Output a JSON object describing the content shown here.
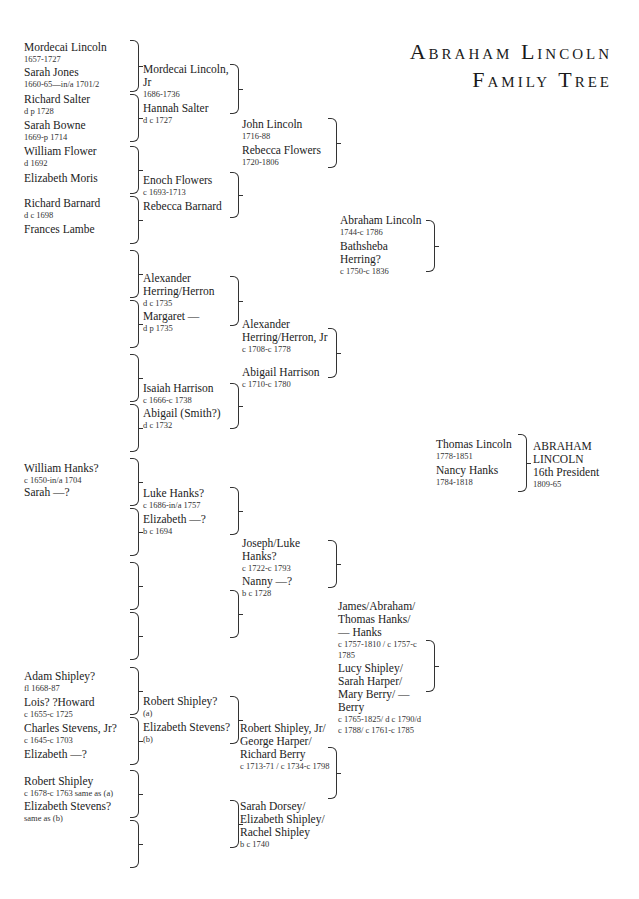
{
  "title": {
    "line1": "Abraham Lincoln",
    "line2": "Family Tree"
  },
  "gen5": [
    {
      "name": "Mordecai Lincoln",
      "dates": "1657-1727"
    },
    {
      "name": "Sarah Jones",
      "dates": "1660-65—in/a 1701/2"
    },
    {
      "name": "Richard Salter",
      "dates": "d p 1728"
    },
    {
      "name": "Sarah Bowne",
      "dates": "1669-p 1714"
    },
    {
      "name": "William Flower",
      "dates": "d 1692"
    },
    {
      "name": "Elizabeth Moris",
      "dates": ""
    },
    {
      "name": "Richard Barnard",
      "dates": "d c 1698"
    },
    {
      "name": "Frances Lambe",
      "dates": ""
    },
    {
      "name": "William Hanks?",
      "dates": "c 1650-in/a 1704"
    },
    {
      "name": "Sarah —?",
      "dates": ""
    },
    {
      "name": "Adam Shipley?",
      "dates": "fl 1668-87"
    },
    {
      "name": "Lois? ?Howard",
      "dates": "c 1655-c 1725"
    },
    {
      "name": "Charles Stevens, Jr?",
      "dates": "c 1645-c 1703"
    },
    {
      "name": "Elizabeth —?",
      "dates": ""
    },
    {
      "name": "Robert Shipley",
      "dates": "c 1678-c 1763 same as (a)"
    },
    {
      "name": "Elizabeth Stevens?",
      "dates": "same as (b)"
    }
  ],
  "gen4": [
    {
      "name": "Mordecai Lincoln, Jr",
      "dates": "1686-1736"
    },
    {
      "name": "Hannah Salter",
      "dates": "d c 1727"
    },
    {
      "name": "Enoch Flowers",
      "dates": "c 1693-1713"
    },
    {
      "name": "Rebecca Barnard",
      "dates": ""
    },
    {
      "name": "Alexander Herring/Herron",
      "dates": "d c 1735"
    },
    {
      "name": "Margaret —",
      "dates": "d p 1735"
    },
    {
      "name": "Isaiah Harrison",
      "dates": "c 1666-c 1738"
    },
    {
      "name": "Abigail (Smith?)",
      "dates": "d c 1732"
    },
    {
      "name": "Luke Hanks?",
      "dates": "c 1686-in/a 1757"
    },
    {
      "name": "Elizabeth —?",
      "dates": "b c 1694"
    },
    {
      "name": "Robert Shipley?",
      "dates": "(a)"
    },
    {
      "name": "Elizabeth Stevens?",
      "dates": "(b)"
    }
  ],
  "gen3": [
    {
      "name": "John Lincoln",
      "dates": "1716-88"
    },
    {
      "name": "Rebecca Flowers",
      "dates": "1720-1806"
    },
    {
      "name": "Alexander Herring/Herron, Jr",
      "dates": "c 1708-c 1778"
    },
    {
      "name": "Abigail Harrison",
      "dates": "c 1710-c 1780"
    },
    {
      "name": "Joseph/Luke Hanks?",
      "dates": "c 1722-c 1793"
    },
    {
      "name": "Nanny —?",
      "dates": "b c 1728"
    },
    {
      "name": "Robert Shipley, Jr/ George Harper/ Richard Berry",
      "dates": "c 1713-71 / c 1734-c 1798"
    },
    {
      "name": "Sarah Dorsey/ Elizabeth Shipley/ Rachel Shipley",
      "dates": "b c 1740"
    }
  ],
  "gen2": [
    {
      "name": "Abraham Lincoln",
      "dates": "1744-c 1786"
    },
    {
      "name": "Bathsheba Herring?",
      "dates": "c 1750-c 1836"
    },
    {
      "name": "James/Abraham/ Thomas Hanks/ — Hanks",
      "dates": "c 1757-1810 / c 1757-c 1785"
    },
    {
      "name": "Lucy Shipley/ Sarah Harper/ Mary Berry/ — Berry",
      "dates": "c 1765-1825/ d c 1790/d c 1788/ c 1761-c 1785"
    }
  ],
  "gen1": [
    {
      "name": "Thomas Lincoln",
      "dates": "1778-1851"
    },
    {
      "name": "Nancy Hanks",
      "dates": "1784-1818"
    }
  ],
  "subject": {
    "line1": "ABRAHAM",
    "line2": "LINCOLN",
    "line3": "16th President",
    "dates": "1809-65"
  }
}
